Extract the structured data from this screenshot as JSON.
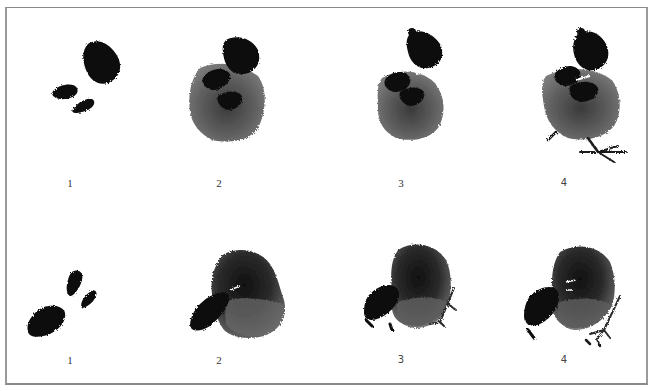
{
  "figure": {
    "rows": [
      {
        "name": "standing-chick",
        "steps": [
          {
            "label": "1"
          },
          {
            "label": "2"
          },
          {
            "label": "3"
          },
          {
            "label": "4"
          }
        ]
      },
      {
        "name": "pecking-chick",
        "steps": [
          {
            "label": "1"
          },
          {
            "label": "2"
          },
          {
            "label": "3"
          },
          {
            "label": "4"
          }
        ]
      }
    ],
    "colors": {
      "ink_dark": "#0a0a0a",
      "ink_wash": "#5e5e5e",
      "ink_light": "#7a7a7a",
      "frame": "#8a8a8a",
      "background": "#ffffff"
    }
  }
}
